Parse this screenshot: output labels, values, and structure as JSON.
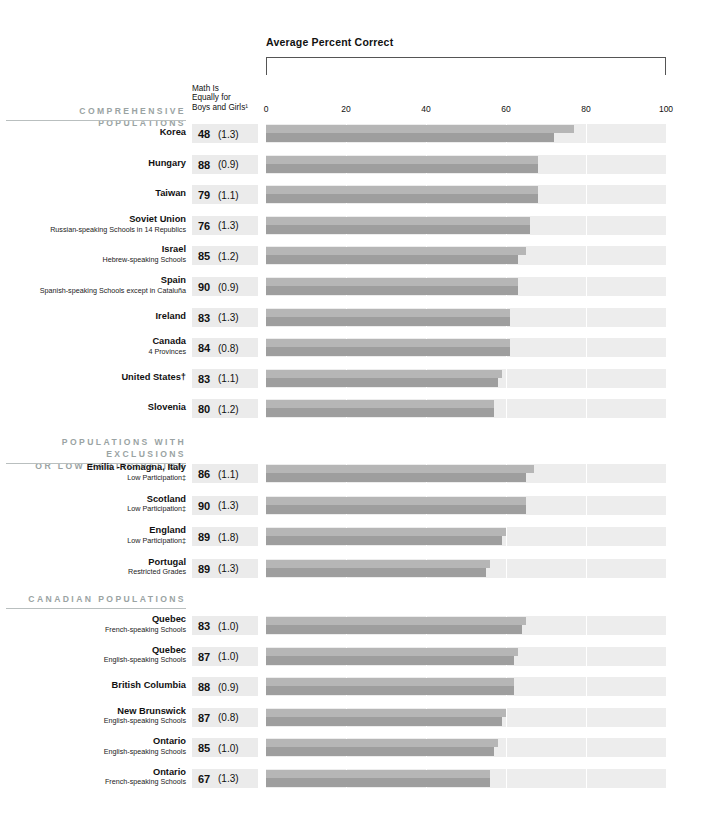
{
  "header": {
    "axis_title": "Average Percent Correct",
    "value_column_head_lines": [
      "Math Is",
      "Equally for",
      "Boys and Girls¹"
    ]
  },
  "axis": {
    "ticks": [
      0,
      20,
      40,
      60,
      80,
      100
    ],
    "tick_labels": [
      "0",
      "20",
      "40",
      "60",
      "80",
      "100"
    ],
    "min": 0,
    "max": 100
  },
  "legend": {
    "boys_color": "#b6b6b6",
    "girls_color": "#9e9e9e",
    "track_color": "#ededed",
    "section_head_color": "#9aa3a3",
    "value_box_color": "#ebebeb"
  },
  "sections": [
    {
      "id": "comprehensive",
      "title_lines": [
        "COMPREHENSIVE POPULATIONS"
      ],
      "rows": [
        {
          "name": "Korea",
          "sub": "",
          "value": "48",
          "se": "(1.3)",
          "boys": 77,
          "girls": 72
        },
        {
          "name": "Hungary",
          "sub": "",
          "value": "88",
          "se": "(0.9)",
          "boys": 68,
          "girls": 68
        },
        {
          "name": "Taiwan",
          "sub": "",
          "value": "79",
          "se": "(1.1)",
          "boys": 68,
          "girls": 68
        },
        {
          "name": "Soviet Union",
          "sub": "Russian-speaking Schools in 14 Republics",
          "value": "76",
          "se": "(1.3)",
          "boys": 66,
          "girls": 66
        },
        {
          "name": "Israel",
          "sub": "Hebrew-speaking Schools",
          "value": "85",
          "se": "(1.2)",
          "boys": 65,
          "girls": 63
        },
        {
          "name": "Spain",
          "sub": "Spanish-speaking Schools except in Cataluña",
          "value": "90",
          "se": "(0.9)",
          "boys": 63,
          "girls": 63
        },
        {
          "name": "Ireland",
          "sub": "",
          "value": "83",
          "se": "(1.3)",
          "boys": 61,
          "girls": 61
        },
        {
          "name": "Canada",
          "sub": "4 Provinces",
          "value": "84",
          "se": "(0.8)",
          "boys": 61,
          "girls": 61
        },
        {
          "name": "United States†",
          "sub": "",
          "value": "83",
          "se": "(1.1)",
          "boys": 59,
          "girls": 58
        },
        {
          "name": "Slovenia",
          "sub": "",
          "value": "80",
          "se": "(1.2)",
          "boys": 57,
          "girls": 57
        }
      ]
    },
    {
      "id": "exclusions",
      "title_lines": [
        "POPULATIONS WITH EXCLUSIONS",
        "OR LOW PARTICIPATION"
      ],
      "rows": [
        {
          "name": "Emilia -Romagna, Italy",
          "sub": "Low Participation‡",
          "value": "86",
          "se": "(1.1)",
          "boys": 67,
          "girls": 65
        },
        {
          "name": "Scotland",
          "sub": "Low Participation‡",
          "value": "90",
          "se": "(1.3)",
          "boys": 65,
          "girls": 65
        },
        {
          "name": "England",
          "sub": "Low Participation‡",
          "value": "89",
          "se": "(1.8)",
          "boys": 60,
          "girls": 59
        },
        {
          "name": "Portugal",
          "sub": "Restricted Grades",
          "value": "89",
          "se": "(1.3)",
          "boys": 56,
          "girls": 55
        }
      ]
    },
    {
      "id": "canadian",
      "title_lines": [
        "CANADIAN POPULATIONS"
      ],
      "rows": [
        {
          "name": "Quebec",
          "sub": "French-speaking Schools",
          "value": "83",
          "se": "(1.0)",
          "boys": 65,
          "girls": 64
        },
        {
          "name": "Quebec",
          "sub": "English-speaking Schools",
          "value": "87",
          "se": "(1.0)",
          "boys": 63,
          "girls": 62
        },
        {
          "name": "British Columbia",
          "sub": "",
          "value": "88",
          "se": "(0.9)",
          "boys": 62,
          "girls": 62
        },
        {
          "name": "New Brunswick",
          "sub": "English-speaking Schools",
          "value": "87",
          "se": "(0.8)",
          "boys": 60,
          "girls": 59
        },
        {
          "name": "Ontario",
          "sub": "English-speaking Schools",
          "value": "85",
          "se": "(1.0)",
          "boys": 58,
          "girls": 57
        },
        {
          "name": "Ontario",
          "sub": "French-speaking Schools",
          "value": "67",
          "se": "(1.3)",
          "boys": 56,
          "girls": 56
        }
      ]
    }
  ],
  "chart_data": {
    "type": "bar",
    "title": "Average Percent Correct",
    "xlabel": "Average Percent Correct",
    "ylabel": "",
    "xlim": [
      0,
      100
    ],
    "grid": true,
    "orientation": "horizontal",
    "legend_position": "none",
    "categories": [
      "Korea",
      "Hungary",
      "Taiwan",
      "Soviet Union",
      "Israel",
      "Spain",
      "Ireland",
      "Canada",
      "United States",
      "Slovenia",
      "Emilia -Romagna, Italy",
      "Scotland",
      "England",
      "Portugal",
      "Quebec (French-speaking Schools)",
      "Quebec (English-speaking Schools)",
      "British Columbia",
      "New Brunswick",
      "Ontario (English-speaking Schools)",
      "Ontario (French-speaking Schools)"
    ],
    "series": [
      {
        "name": "Boys",
        "values": [
          77,
          68,
          68,
          66,
          65,
          63,
          61,
          61,
          59,
          57,
          67,
          65,
          60,
          56,
          65,
          63,
          62,
          60,
          58,
          56
        ]
      },
      {
        "name": "Girls",
        "values": [
          72,
          68,
          68,
          66,
          63,
          63,
          61,
          61,
          58,
          57,
          65,
          65,
          59,
          55,
          64,
          62,
          62,
          59,
          57,
          56
        ]
      }
    ],
    "side_table": {
      "column_header": "Math Is Equally for Boys and Girls¹",
      "values": [
        "48",
        "88",
        "79",
        "76",
        "85",
        "90",
        "83",
        "84",
        "83",
        "80",
        "86",
        "90",
        "89",
        "89",
        "83",
        "87",
        "88",
        "87",
        "85",
        "67"
      ],
      "standard_errors": [
        "(1.3)",
        "(0.9)",
        "(1.1)",
        "(1.3)",
        "(1.2)",
        "(0.9)",
        "(1.3)",
        "(0.8)",
        "(1.1)",
        "(1.2)",
        "(1.1)",
        "(1.3)",
        "(1.8)",
        "(1.3)",
        "(1.0)",
        "(1.0)",
        "(0.9)",
        "(0.8)",
        "(1.0)",
        "(1.3)"
      ]
    }
  }
}
